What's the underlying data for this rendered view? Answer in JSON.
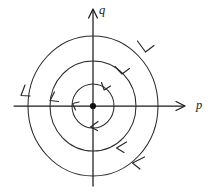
{
  "figure": {
    "kind": "phase-portrait",
    "background_color": "#ffffff",
    "stroke_color": "#2a2a2a",
    "axis_color": "#1b1b1b",
    "equilibrium_color": "#101010"
  },
  "axes": {
    "horizontal": {
      "label": "p",
      "label_x": 196,
      "label_y": 109,
      "x_start": 14,
      "x_end": 184,
      "y": 106,
      "arrow_direction": "right"
    },
    "vertical": {
      "label": "q",
      "label_x": 99,
      "label_y": 14,
      "y_start": 186,
      "y_end": 10,
      "x": 93,
      "arrow_direction": "up"
    }
  },
  "origin": {
    "label": "equilibrium-point",
    "x": 93,
    "y": 106,
    "radius": 3.1
  },
  "chart_data": {
    "type": "scatter",
    "title": "",
    "xlabel": "p",
    "ylabel": "q",
    "grid": false,
    "legend": null,
    "center": [
      93,
      106
    ],
    "rotation": "clockwise",
    "orbits": [
      {
        "name": "inner-orbit",
        "rx": 21,
        "ry": 22
      },
      {
        "name": "middle-orbit",
        "rx": 43,
        "ry": 45
      },
      {
        "name": "outer-orbit",
        "rx": 65,
        "ry": 70
      }
    ],
    "flow_arrows": [
      {
        "orbit": "inner-orbit",
        "angle_deg": 62,
        "direction": "clockwise"
      },
      {
        "orbit": "inner-orbit",
        "angle_deg": 186,
        "direction": "clockwise"
      },
      {
        "orbit": "inner-orbit",
        "angle_deg": 268,
        "direction": "clockwise"
      },
      {
        "orbit": "middle-orbit",
        "angle_deg": 48,
        "direction": "clockwise"
      },
      {
        "orbit": "middle-orbit",
        "angle_deg": 176,
        "direction": "clockwise"
      },
      {
        "orbit": "middle-orbit",
        "angle_deg": 300,
        "direction": "clockwise"
      },
      {
        "orbit": "outer-orbit",
        "angle_deg": 40,
        "direction": "clockwise"
      },
      {
        "orbit": "outer-orbit",
        "angle_deg": 172,
        "direction": "clockwise"
      },
      {
        "orbit": "outer-orbit",
        "angle_deg": 312,
        "direction": "clockwise"
      }
    ]
  }
}
